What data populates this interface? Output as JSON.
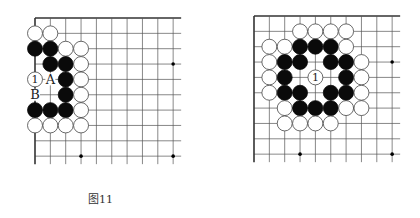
{
  "figures": [
    {
      "id": "fig11",
      "caption": "图11",
      "grid": {
        "origin_x": 35,
        "origin_y": 18,
        "spacing": 15.35,
        "cols": 10,
        "rows": 10,
        "extend_right": 8,
        "extend_bottom": 8
      },
      "star_points": [
        [
          9,
          3
        ],
        [
          3,
          9
        ],
        [
          9,
          9
        ]
      ],
      "stones": [
        {
          "c": 0,
          "r": 1,
          "color": "white"
        },
        {
          "c": 1,
          "r": 1,
          "color": "white"
        },
        {
          "c": 0,
          "r": 2,
          "color": "black"
        },
        {
          "c": 1,
          "r": 2,
          "color": "black"
        },
        {
          "c": 2,
          "r": 2,
          "color": "white"
        },
        {
          "c": 3,
          "r": 2,
          "color": "white"
        },
        {
          "c": 1,
          "r": 3,
          "color": "black"
        },
        {
          "c": 2,
          "r": 3,
          "color": "black"
        },
        {
          "c": 3,
          "r": 3,
          "color": "white"
        },
        {
          "c": 0,
          "r": 4,
          "color": "white",
          "label": "1"
        },
        {
          "c": 2,
          "r": 4,
          "color": "black"
        },
        {
          "c": 3,
          "r": 4,
          "color": "white"
        },
        {
          "c": 2,
          "r": 5,
          "color": "black"
        },
        {
          "c": 3,
          "r": 5,
          "color": "white"
        },
        {
          "c": 0,
          "r": 6,
          "color": "black"
        },
        {
          "c": 1,
          "r": 6,
          "color": "black"
        },
        {
          "c": 2,
          "r": 6,
          "color": "black"
        },
        {
          "c": 3,
          "r": 6,
          "color": "white"
        },
        {
          "c": 0,
          "r": 7,
          "color": "white"
        },
        {
          "c": 1,
          "r": 7,
          "color": "white"
        },
        {
          "c": 2,
          "r": 7,
          "color": "white"
        },
        {
          "c": 3,
          "r": 7,
          "color": "white"
        }
      ],
      "point_labels": [
        {
          "c": 1,
          "r": 4,
          "text": "A"
        },
        {
          "c": 0,
          "r": 5,
          "text": "B"
        }
      ]
    },
    {
      "id": "fig12",
      "caption": "图12",
      "grid": {
        "origin_x": 44,
        "origin_y": 16,
        "spacing": 15.35,
        "cols": 10,
        "rows": 10,
        "extend_right": 8,
        "extend_bottom": 8
      },
      "star_points": [
        [
          9,
          3
        ],
        [
          3,
          9
        ],
        [
          9,
          9
        ]
      ],
      "stones": [
        {
          "c": 3,
          "r": 1,
          "color": "white"
        },
        {
          "c": 4,
          "r": 1,
          "color": "white"
        },
        {
          "c": 5,
          "r": 1,
          "color": "white"
        },
        {
          "c": 6,
          "r": 1,
          "color": "white"
        },
        {
          "c": 1,
          "r": 2,
          "color": "white"
        },
        {
          "c": 2,
          "r": 2,
          "color": "white"
        },
        {
          "c": 3,
          "r": 2,
          "color": "black"
        },
        {
          "c": 4,
          "r": 2,
          "color": "black"
        },
        {
          "c": 5,
          "r": 2,
          "color": "black"
        },
        {
          "c": 6,
          "r": 2,
          "color": "white"
        },
        {
          "c": 1,
          "r": 3,
          "color": "white"
        },
        {
          "c": 2,
          "r": 3,
          "color": "black"
        },
        {
          "c": 3,
          "r": 3,
          "color": "black"
        },
        {
          "c": 5,
          "r": 3,
          "color": "black"
        },
        {
          "c": 6,
          "r": 3,
          "color": "black"
        },
        {
          "c": 7,
          "r": 3,
          "color": "white"
        },
        {
          "c": 1,
          "r": 4,
          "color": "white"
        },
        {
          "c": 2,
          "r": 4,
          "color": "black"
        },
        {
          "c": 4,
          "r": 4,
          "color": "white",
          "label": "1"
        },
        {
          "c": 6,
          "r": 4,
          "color": "black"
        },
        {
          "c": 7,
          "r": 4,
          "color": "white"
        },
        {
          "c": 1,
          "r": 5,
          "color": "white"
        },
        {
          "c": 2,
          "r": 5,
          "color": "black"
        },
        {
          "c": 3,
          "r": 5,
          "color": "black"
        },
        {
          "c": 5,
          "r": 5,
          "color": "black"
        },
        {
          "c": 6,
          "r": 5,
          "color": "black"
        },
        {
          "c": 7,
          "r": 5,
          "color": "white"
        },
        {
          "c": 2,
          "r": 6,
          "color": "white"
        },
        {
          "c": 3,
          "r": 6,
          "color": "black"
        },
        {
          "c": 4,
          "r": 6,
          "color": "black"
        },
        {
          "c": 5,
          "r": 6,
          "color": "black"
        },
        {
          "c": 6,
          "r": 6,
          "color": "white"
        },
        {
          "c": 7,
          "r": 6,
          "color": "white"
        },
        {
          "c": 2,
          "r": 7,
          "color": "white"
        },
        {
          "c": 3,
          "r": 7,
          "color": "white"
        },
        {
          "c": 4,
          "r": 7,
          "color": "white"
        },
        {
          "c": 5,
          "r": 7,
          "color": "white"
        }
      ],
      "point_labels": []
    }
  ],
  "colors": {
    "line": "#555555",
    "edge": "#333333",
    "black_stone": "#0a0a0a",
    "white_stone": "#ffffff",
    "stone_outline": "#444444"
  }
}
